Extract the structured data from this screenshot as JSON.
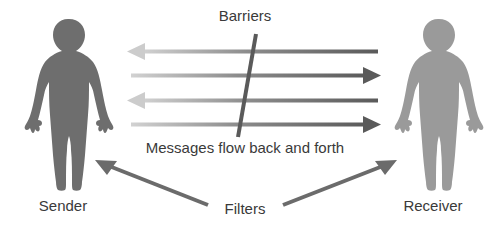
{
  "diagram": {
    "background_color": "#ffffff",
    "width": 490,
    "height": 234,
    "labels": {
      "barriers": "Barriers",
      "messages": "Messages flow back and forth",
      "filters": "Filters",
      "sender": "Sender",
      "receiver": "Receiver"
    },
    "colors": {
      "sender_figure": "#6e6e6e",
      "receiver_figure": "#9a9a9a",
      "arrow_dark": "#5a5a5a",
      "arrow_light": "#c9c9c9",
      "barrier_line": "#5a5a5a",
      "filter_arrow": "#6b6b6b",
      "text": "#3a3a3a"
    },
    "figures": [
      {
        "name": "sender",
        "label": "Sender",
        "side": "left",
        "fill": "#6e6e6e"
      },
      {
        "name": "receiver",
        "label": "Receiver",
        "side": "right",
        "fill": "#9a9a9a"
      }
    ],
    "message_arrows": [
      {
        "index": 1,
        "direction": "left",
        "y": 52,
        "x_start": 378,
        "x_end": 127
      },
      {
        "index": 2,
        "direction": "right",
        "y": 76,
        "x_start": 131,
        "x_end": 381
      },
      {
        "index": 3,
        "direction": "left",
        "y": 101,
        "x_start": 378,
        "x_end": 127
      },
      {
        "index": 4,
        "direction": "right",
        "y": 125,
        "x_start": 131,
        "x_end": 381
      }
    ],
    "barrier": {
      "name": "barrier-line",
      "x_top": 256,
      "y_top": 34,
      "x_bottom": 238,
      "y_bottom": 137
    },
    "filter_arrows": [
      {
        "name": "filter-arrow-to-sender",
        "direction": "up-left",
        "x_start": 208,
        "y_start": 205,
        "x_end": 96,
        "y_end": 160
      },
      {
        "name": "filter-arrow-to-receiver",
        "direction": "up-right",
        "x_start": 283,
        "y_start": 205,
        "x_end": 398,
        "y_end": 160
      }
    ]
  }
}
